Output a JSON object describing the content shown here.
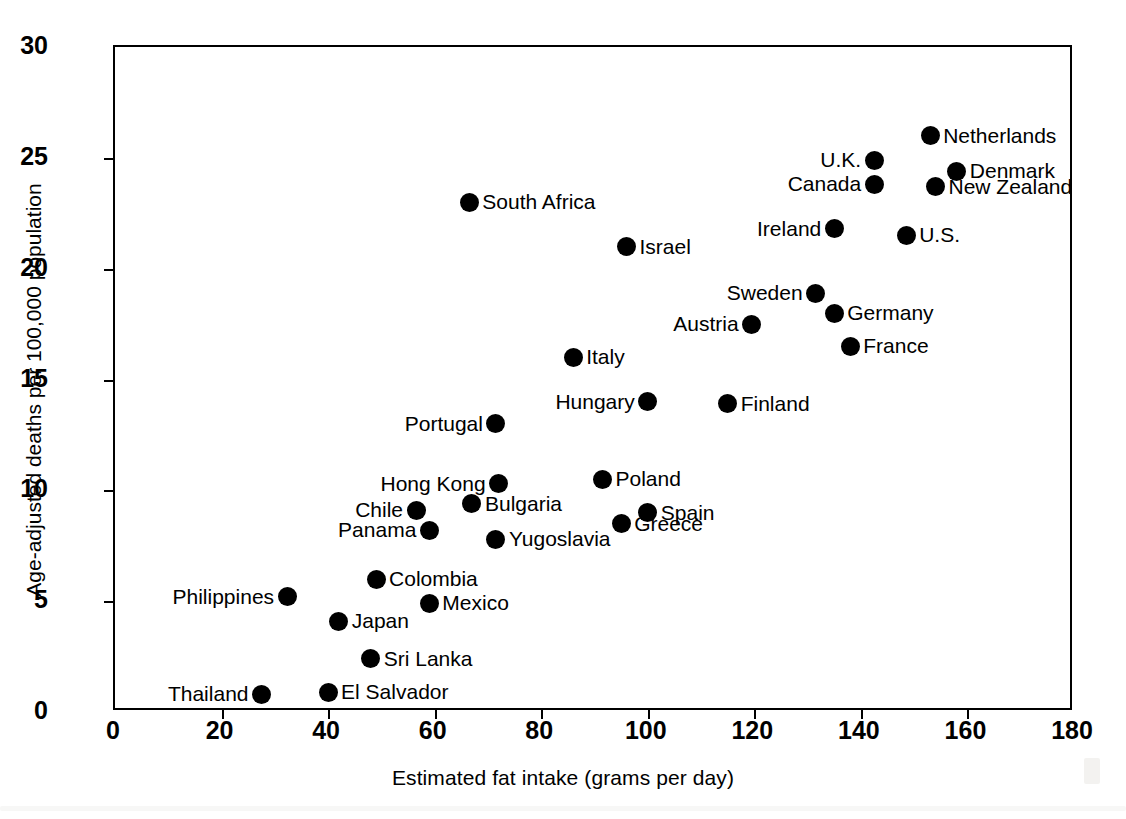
{
  "chart_data": {
    "type": "scatter",
    "title": "",
    "xlabel": "Estimated fat intake (grams per day)",
    "ylabel": "Age-adjusted deaths per 100,000 population",
    "xlim": [
      0,
      180
    ],
    "ylim": [
      0,
      30
    ],
    "xticks": [
      0,
      20,
      40,
      60,
      80,
      100,
      120,
      140,
      160,
      180
    ],
    "yticks": [
      0,
      5,
      10,
      15,
      20,
      25,
      30
    ],
    "grid": false,
    "legend": null,
    "marker_color": "#000000",
    "points": [
      {
        "label": "Netherlands",
        "x": 153.0,
        "y": 26.0,
        "side": "right"
      },
      {
        "label": "U.K.",
        "x": 142.5,
        "y": 24.9,
        "side": "left"
      },
      {
        "label": "Denmark",
        "x": 158.0,
        "y": 24.4,
        "side": "right"
      },
      {
        "label": "Canada",
        "x": 142.5,
        "y": 23.8,
        "side": "left"
      },
      {
        "label": "New Zealand",
        "x": 154.0,
        "y": 23.7,
        "side": "right"
      },
      {
        "label": "South Africa",
        "x": 66.5,
        "y": 23.0,
        "side": "right"
      },
      {
        "label": "Ireland",
        "x": 135.0,
        "y": 21.8,
        "side": "left"
      },
      {
        "label": "U.S.",
        "x": 148.5,
        "y": 21.5,
        "side": "right"
      },
      {
        "label": "Israel",
        "x": 96.0,
        "y": 21.0,
        "side": "right"
      },
      {
        "label": "Sweden",
        "x": 131.5,
        "y": 18.9,
        "side": "left"
      },
      {
        "label": "Germany",
        "x": 135.0,
        "y": 18.0,
        "side": "right"
      },
      {
        "label": "Austria",
        "x": 119.5,
        "y": 17.5,
        "side": "left"
      },
      {
        "label": "France",
        "x": 138.0,
        "y": 16.5,
        "side": "right"
      },
      {
        "label": "Italy",
        "x": 86.0,
        "y": 16.0,
        "side": "right"
      },
      {
        "label": "Hungary",
        "x": 100.0,
        "y": 14.0,
        "side": "left"
      },
      {
        "label": "Finland",
        "x": 115.0,
        "y": 13.9,
        "side": "right"
      },
      {
        "label": "Portugal",
        "x": 71.5,
        "y": 13.0,
        "side": "left"
      },
      {
        "label": "Poland",
        "x": 91.5,
        "y": 10.5,
        "side": "right"
      },
      {
        "label": "Hong Kong",
        "x": 72.0,
        "y": 10.3,
        "side": "left"
      },
      {
        "label": "Bulgaria",
        "x": 67.0,
        "y": 9.4,
        "side": "right"
      },
      {
        "label": "Chile",
        "x": 56.5,
        "y": 9.1,
        "side": "left"
      },
      {
        "label": "Spain",
        "x": 100.0,
        "y": 9.0,
        "side": "right"
      },
      {
        "label": "Greece",
        "x": 95.0,
        "y": 8.5,
        "side": "right"
      },
      {
        "label": "Panama",
        "x": 59.0,
        "y": 8.2,
        "side": "left"
      },
      {
        "label": "Yugoslavia",
        "x": 71.5,
        "y": 7.8,
        "side": "right"
      },
      {
        "label": "Colombia",
        "x": 49.0,
        "y": 6.0,
        "side": "right"
      },
      {
        "label": "Philippines",
        "x": 32.3,
        "y": 5.2,
        "side": "left"
      },
      {
        "label": "Mexico",
        "x": 59.0,
        "y": 4.9,
        "side": "right"
      },
      {
        "label": "Japan",
        "x": 42.0,
        "y": 4.1,
        "side": "right"
      },
      {
        "label": "Sri Lanka",
        "x": 48.0,
        "y": 2.4,
        "side": "right"
      },
      {
        "label": "El Salvador",
        "x": 40.0,
        "y": 0.9,
        "side": "right"
      },
      {
        "label": "Thailand",
        "x": 27.5,
        "y": 0.8,
        "side": "left"
      }
    ]
  }
}
